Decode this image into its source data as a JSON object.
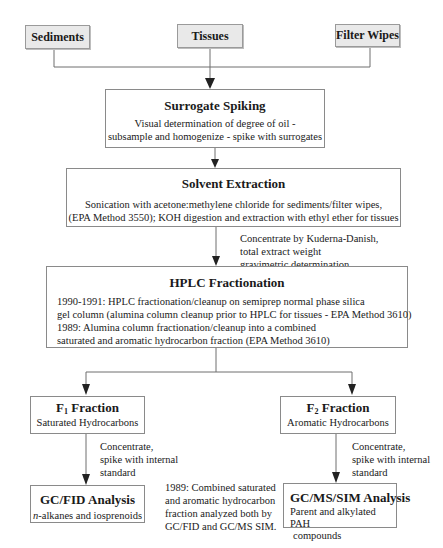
{
  "sources": [
    {
      "label": "Sediments"
    },
    {
      "label": "Tissues"
    },
    {
      "label": "Filter Wipes"
    }
  ],
  "surrogate": {
    "title": "Surrogate Spiking",
    "lines": [
      "Visual determination of degree of oil -",
      "subsample and homogenize - spike with surrogates"
    ]
  },
  "extraction": {
    "title": "Solvent Extraction",
    "lines": [
      "Sonication with acetone:methylene chloride for sediments/filter wipes,",
      "(EPA Method 3550); KOH digestion and extraction with ethyl ether for tissues"
    ]
  },
  "concentrate_note": {
    "lines": [
      "Concentrate by Kuderna-Danish,",
      "total extract weight",
      "gravimetric determination"
    ]
  },
  "hplc": {
    "title": "HPLC Fractionation",
    "lines": [
      "1990-1991:  HPLC fractionation/cleanup on semiprep normal phase silica",
      "gel column (alumina column cleanup prior to HPLC for tissues - EPA Method 3610)",
      "1989:  Alumina column fractionation/cleanup into a combined",
      "saturated and aromatic hydrocarbon fraction (EPA Method 3610)"
    ]
  },
  "f1": {
    "title_prefix": "F",
    "title_sub": "1",
    "title_suffix": " Fraction",
    "subtitle": "Saturated Hydrocarbons",
    "note_lines": [
      "Concentrate,",
      "spike with internal",
      "standard"
    ]
  },
  "f2": {
    "title_prefix": "F",
    "title_sub": "2",
    "title_suffix": " Fraction",
    "subtitle": "Aromatic Hydrocarbons",
    "note_lines": [
      "Concentrate,",
      "spike with internal",
      "standard"
    ]
  },
  "gcfid": {
    "title": "GC/FID Analysis",
    "sub_italic": "n",
    "sub_rest": "-alkanes and iosprenoids"
  },
  "gcms": {
    "title": "GC/MS/SIM Analysis",
    "lines": [
      "Parent and alkylated PAH",
      "compounds"
    ]
  },
  "combined_note": {
    "lines": [
      "1989:  Combined saturated",
      "and aromatic hydrocarbon",
      "fraction analyzed both by",
      "GC/FID and GC/MS SIM."
    ]
  },
  "colors": {
    "line": "#6e6e6e",
    "source_fill": "#e9e9e9",
    "arrow": "#222222"
  }
}
